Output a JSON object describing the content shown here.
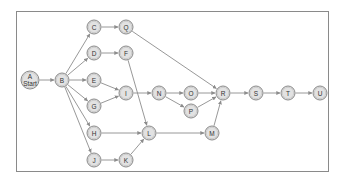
{
  "diagram": {
    "type": "network-activity-diagram",
    "nodes": [
      {
        "id": "A",
        "label": "A",
        "sublabel": "Start",
        "x": 30,
        "y": 80,
        "r": 9
      },
      {
        "id": "B",
        "label": "B",
        "x": 62,
        "y": 80,
        "r": 7
      },
      {
        "id": "C",
        "label": "C",
        "x": 94,
        "y": 27,
        "r": 7
      },
      {
        "id": "Q",
        "label": "Q",
        "x": 126,
        "y": 27,
        "r": 7
      },
      {
        "id": "D",
        "label": "D",
        "x": 94,
        "y": 53,
        "r": 7
      },
      {
        "id": "F",
        "label": "F",
        "x": 126,
        "y": 53,
        "r": 7
      },
      {
        "id": "E",
        "label": "E",
        "x": 94,
        "y": 80,
        "r": 7
      },
      {
        "id": "G",
        "label": "G",
        "x": 94,
        "y": 106,
        "r": 7
      },
      {
        "id": "I",
        "label": "I",
        "x": 126,
        "y": 93,
        "r": 7
      },
      {
        "id": "N",
        "label": "N",
        "x": 159,
        "y": 93,
        "r": 7
      },
      {
        "id": "O",
        "label": "O",
        "x": 191,
        "y": 93,
        "r": 7
      },
      {
        "id": "P",
        "label": "P",
        "x": 191,
        "y": 111,
        "r": 7
      },
      {
        "id": "R",
        "label": "R",
        "x": 223,
        "y": 93,
        "r": 7
      },
      {
        "id": "S",
        "label": "S",
        "x": 256,
        "y": 93,
        "r": 7
      },
      {
        "id": "T",
        "label": "T",
        "x": 288,
        "y": 93,
        "r": 7
      },
      {
        "id": "U",
        "label": "U",
        "x": 320,
        "y": 93,
        "r": 7
      },
      {
        "id": "H",
        "label": "H",
        "x": 94,
        "y": 133,
        "r": 7
      },
      {
        "id": "L",
        "label": "L",
        "x": 149,
        "y": 133,
        "r": 7
      },
      {
        "id": "M",
        "label": "M",
        "x": 212,
        "y": 133,
        "r": 7
      },
      {
        "id": "J",
        "label": "J",
        "x": 94,
        "y": 160,
        "r": 7
      },
      {
        "id": "K",
        "label": "K",
        "x": 126,
        "y": 160,
        "r": 7
      }
    ],
    "edges": [
      {
        "from": "A",
        "to": "B"
      },
      {
        "from": "B",
        "to": "C"
      },
      {
        "from": "B",
        "to": "D"
      },
      {
        "from": "B",
        "to": "E"
      },
      {
        "from": "B",
        "to": "G"
      },
      {
        "from": "B",
        "to": "H"
      },
      {
        "from": "B",
        "to": "J"
      },
      {
        "from": "C",
        "to": "Q"
      },
      {
        "from": "D",
        "to": "F"
      },
      {
        "from": "Q",
        "to": "R"
      },
      {
        "from": "F",
        "to": "L"
      },
      {
        "from": "E",
        "to": "I"
      },
      {
        "from": "G",
        "to": "I"
      },
      {
        "from": "I",
        "to": "N"
      },
      {
        "from": "N",
        "to": "O"
      },
      {
        "from": "N",
        "to": "P"
      },
      {
        "from": "O",
        "to": "R"
      },
      {
        "from": "P",
        "to": "R"
      },
      {
        "from": "H",
        "to": "L"
      },
      {
        "from": "J",
        "to": "K"
      },
      {
        "from": "K",
        "to": "L"
      },
      {
        "from": "L",
        "to": "M"
      },
      {
        "from": "M",
        "to": "R"
      },
      {
        "from": "R",
        "to": "S"
      },
      {
        "from": "S",
        "to": "T"
      },
      {
        "from": "T",
        "to": "U"
      }
    ]
  }
}
